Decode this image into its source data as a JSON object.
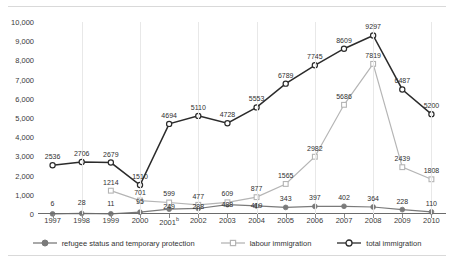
{
  "chart_data": {
    "type": "line",
    "title": "",
    "subtitle": "",
    "xlabel": "",
    "ylabel": "",
    "grid": "vertical",
    "legend_position": "bottom",
    "ylim": [
      0,
      10000
    ],
    "ytick_step": 1000,
    "categories": [
      "1997",
      "1998",
      "1999",
      "2000",
      "2001",
      "2002",
      "2003",
      "2004",
      "2005",
      "2006",
      "2007",
      "2008",
      "2009",
      "2010"
    ],
    "category_labels": [
      "1997",
      "1998",
      "1999",
      "2000",
      "2001b",
      "2002",
      "2003",
      "2004",
      "2005",
      "2006",
      "2007",
      "2008",
      "2009",
      "2010"
    ],
    "ytick_labels": [
      "0",
      "1,000",
      "2,000",
      "3,000",
      "4,000",
      "5,000",
      "6,000",
      "7,000",
      "8,000",
      "9,000",
      "10,000"
    ],
    "series": [
      {
        "name": "refugee status and temporary protection",
        "color": "#7a7a7a",
        "marker": "filled-circle",
        "values": [
          6,
          28,
          11,
          95,
          249,
          288,
          488,
          419,
          343,
          397,
          402,
          364,
          228,
          110
        ],
        "labels": [
          "6",
          "28",
          "11",
          "95",
          "249",
          "288",
          "488",
          "419",
          "343",
          "397",
          "402",
          "364",
          "228",
          "110"
        ]
      },
      {
        "name": "labour immigration",
        "color": "#b5b5b5",
        "marker": "open-square",
        "values": [
          null,
          null,
          1214,
          701,
          599,
          477,
          609,
          877,
          1565,
          2982,
          5686,
          7819,
          2439,
          1808
        ],
        "labels": [
          null,
          null,
          "1214",
          "701",
          "599",
          "477",
          "609",
          "877",
          "1565",
          "2982",
          "5686",
          "7819",
          "2439",
          "1808"
        ]
      },
      {
        "name": "total immigration",
        "color": "#2b2b2b",
        "marker": "open-circle",
        "values": [
          2536,
          2706,
          2679,
          1510,
          4694,
          5110,
          4728,
          5553,
          6789,
          7745,
          8609,
          9297,
          6487,
          5200
        ],
        "labels": [
          "2536",
          "2706",
          "2679",
          "1510",
          "4694",
          "5110",
          "4728",
          "5553",
          "6789",
          "7745",
          "8609",
          "9297",
          "6487",
          "5200"
        ]
      }
    ]
  },
  "legend": {
    "items": [
      {
        "label": "refugee status and temporary protection"
      },
      {
        "label": "labour immigration"
      },
      {
        "label": "total immigration"
      }
    ]
  }
}
